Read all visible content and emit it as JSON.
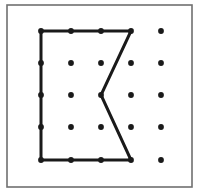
{
  "figure": {
    "name": "geoboard-polygon-figure",
    "kind": "geoboard-pegboard-diagram",
    "width": 201,
    "height": 194,
    "background_color": "#ffffff",
    "title_text": ""
  },
  "frame": {
    "name": "outer-border",
    "x": 7,
    "y": 5,
    "width": 185,
    "height": 182,
    "stroke_color": "#707070",
    "stroke_width": 1.6,
    "fill_color": "#ffffff"
  },
  "grid": {
    "rows": 5,
    "columns": 5,
    "column_x": [
      41,
      71,
      101,
      131,
      161
    ],
    "row_y": [
      31,
      63,
      95,
      127,
      160
    ],
    "spacing_x": 30,
    "spacing_y": 32,
    "dot_radius": 2.9,
    "dot_color": "#1a1a1a",
    "dots": [
      {
        "id": "dot-r1c1",
        "col": 1,
        "row": 1,
        "x": 41,
        "y": 31,
        "on_outline": true
      },
      {
        "id": "dot-r1c2",
        "col": 2,
        "row": 1,
        "x": 71,
        "y": 31,
        "on_outline": true
      },
      {
        "id": "dot-r1c3",
        "col": 3,
        "row": 1,
        "x": 101,
        "y": 31,
        "on_outline": true
      },
      {
        "id": "dot-r1c4",
        "col": 4,
        "row": 1,
        "x": 131,
        "y": 31,
        "on_outline": true
      },
      {
        "id": "dot-r1c5",
        "col": 5,
        "row": 1,
        "x": 161,
        "y": 31,
        "on_outline": false
      },
      {
        "id": "dot-r2c1",
        "col": 1,
        "row": 2,
        "x": 41,
        "y": 63,
        "on_outline": true
      },
      {
        "id": "dot-r2c2",
        "col": 2,
        "row": 2,
        "x": 71,
        "y": 63,
        "on_outline": false
      },
      {
        "id": "dot-r2c3",
        "col": 3,
        "row": 2,
        "x": 101,
        "y": 63,
        "on_outline": false
      },
      {
        "id": "dot-r2c4",
        "col": 4,
        "row": 2,
        "x": 131,
        "y": 63,
        "on_outline": false
      },
      {
        "id": "dot-r2c5",
        "col": 5,
        "row": 2,
        "x": 161,
        "y": 63,
        "on_outline": false
      },
      {
        "id": "dot-r3c1",
        "col": 1,
        "row": 3,
        "x": 41,
        "y": 95,
        "on_outline": true
      },
      {
        "id": "dot-r3c2",
        "col": 2,
        "row": 3,
        "x": 71,
        "y": 95,
        "on_outline": false
      },
      {
        "id": "dot-r3c3",
        "col": 3,
        "row": 3,
        "x": 101,
        "y": 95,
        "on_outline": true
      },
      {
        "id": "dot-r3c4",
        "col": 4,
        "row": 3,
        "x": 131,
        "y": 95,
        "on_outline": false
      },
      {
        "id": "dot-r3c5",
        "col": 5,
        "row": 3,
        "x": 161,
        "y": 95,
        "on_outline": false
      },
      {
        "id": "dot-r4c1",
        "col": 1,
        "row": 4,
        "x": 41,
        "y": 127,
        "on_outline": true
      },
      {
        "id": "dot-r4c2",
        "col": 2,
        "row": 4,
        "x": 71,
        "y": 127,
        "on_outline": false
      },
      {
        "id": "dot-r4c3",
        "col": 3,
        "row": 4,
        "x": 101,
        "y": 127,
        "on_outline": false
      },
      {
        "id": "dot-r4c4",
        "col": 4,
        "row": 4,
        "x": 131,
        "y": 127,
        "on_outline": false
      },
      {
        "id": "dot-r4c5",
        "col": 5,
        "row": 4,
        "x": 161,
        "y": 127,
        "on_outline": false
      },
      {
        "id": "dot-r5c1",
        "col": 1,
        "row": 5,
        "x": 41,
        "y": 160,
        "on_outline": true
      },
      {
        "id": "dot-r5c2",
        "col": 2,
        "row": 5,
        "x": 71,
        "y": 160,
        "on_outline": true
      },
      {
        "id": "dot-r5c3",
        "col": 3,
        "row": 5,
        "x": 101,
        "y": 160,
        "on_outline": true
      },
      {
        "id": "dot-r5c4",
        "col": 4,
        "row": 5,
        "x": 131,
        "y": 160,
        "on_outline": true
      },
      {
        "id": "dot-r5c5",
        "col": 5,
        "row": 5,
        "x": 161,
        "y": 160,
        "on_outline": false
      }
    ]
  },
  "polygon": {
    "name": "polygon-outline",
    "shape_description": "concave pentagon / arrowhead notch opening to the right",
    "stroke_color": "#1a1a1a",
    "stroke_width": 3,
    "fill_color": "none",
    "closed": true,
    "vertices": [
      {
        "id": "vertex-top-left",
        "col": 1,
        "row": 1,
        "x": 41,
        "y": 31
      },
      {
        "id": "vertex-top-right",
        "col": 4,
        "row": 1,
        "x": 131,
        "y": 31
      },
      {
        "id": "vertex-notch-middle",
        "col": 3,
        "row": 3,
        "x": 101,
        "y": 95
      },
      {
        "id": "vertex-bottom-right",
        "col": 4,
        "row": 5,
        "x": 131,
        "y": 160
      },
      {
        "id": "vertex-bottom-left",
        "col": 1,
        "row": 5,
        "x": 41,
        "y": 160
      }
    ],
    "points_attr": "41,31 131,31 101,95 131,160 41,160",
    "edges": [
      {
        "id": "edge-top",
        "from": "vertex-top-left",
        "to": "vertex-top-right",
        "orientation": "horizontal"
      },
      {
        "id": "edge-upper-diagonal",
        "from": "vertex-top-right",
        "to": "vertex-notch-middle",
        "orientation": "diagonal"
      },
      {
        "id": "edge-lower-diagonal",
        "from": "vertex-notch-middle",
        "to": "vertex-bottom-right",
        "orientation": "diagonal"
      },
      {
        "id": "edge-bottom",
        "from": "vertex-bottom-right",
        "to": "vertex-bottom-left",
        "orientation": "horizontal"
      },
      {
        "id": "edge-left",
        "from": "vertex-bottom-left",
        "to": "vertex-top-left",
        "orientation": "vertical"
      }
    ]
  }
}
